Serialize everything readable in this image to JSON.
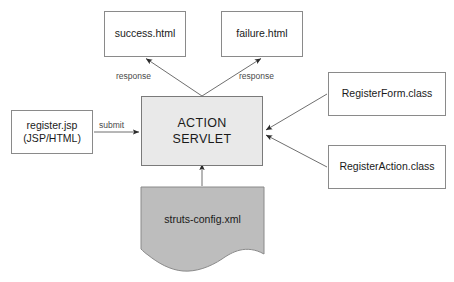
{
  "diagram": {
    "background_color": "#ffffff",
    "line_color": "#6f6f6f",
    "text_color": "#1a1a1a",
    "shaded_fill": "#e9e9e9",
    "document_fill": "#bdbdbd"
  },
  "nodes": {
    "success": {
      "label": "success.html",
      "shape": "rect",
      "fill": "#ffffff"
    },
    "failure": {
      "label": "failure.html",
      "shape": "rect",
      "fill": "#ffffff"
    },
    "register": {
      "label": "register.jsp\n(JSP/HTML)",
      "shape": "rect",
      "fill": "#ffffff"
    },
    "servlet": {
      "label": "ACTION\nSERVLET",
      "shape": "rect",
      "fill": "#e9e9e9"
    },
    "register_form": {
      "label": "RegisterForm.class",
      "shape": "rect",
      "fill": "#ffffff"
    },
    "register_action": {
      "label": "RegisterAction.class",
      "shape": "rect",
      "fill": "#ffffff"
    },
    "struts_config": {
      "label": "struts-config.xml",
      "shape": "document",
      "fill": "#bdbdbd"
    }
  },
  "edges": {
    "submit": {
      "label": "submit",
      "from": "register",
      "to": "servlet",
      "direction": "right"
    },
    "response_left": {
      "label": "response",
      "from": "servlet",
      "to": "success",
      "direction": "up-left"
    },
    "response_right": {
      "label": "response",
      "from": "servlet",
      "to": "failure",
      "direction": "up-right"
    },
    "form_to_servlet": {
      "label": "",
      "from": "register_form",
      "to": "servlet",
      "direction": "left"
    },
    "action_to_servlet": {
      "label": "",
      "from": "register_action",
      "to": "servlet",
      "direction": "left"
    },
    "config_to_servlet": {
      "label": "",
      "from": "struts_config",
      "to": "servlet",
      "direction": "up"
    }
  }
}
